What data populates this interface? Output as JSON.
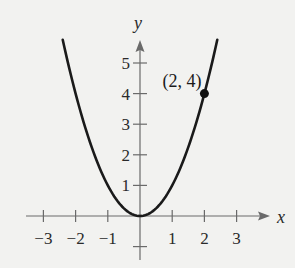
{
  "chart_data": {
    "type": "line",
    "title": "",
    "function": "y = x^2",
    "xlabel": "x",
    "ylabel": "y",
    "xlim": [
      -3,
      3
    ],
    "ylim": [
      -1,
      5.8
    ],
    "x_ticks": [
      -3,
      -2,
      -1,
      1,
      2,
      3
    ],
    "x_tick_labels": [
      "−3",
      "−2",
      "−1",
      "1",
      "2",
      "3"
    ],
    "y_ticks": [
      1,
      2,
      3,
      4,
      5
    ],
    "y_tick_labels": [
      "1",
      "2",
      "3",
      "4",
      "5"
    ],
    "grid": false,
    "series": [
      {
        "name": "parabola",
        "x": [
          -2.4,
          -2,
          -1.5,
          -1,
          -0.5,
          0,
          0.5,
          1,
          1.5,
          2,
          2.4
        ],
        "y": [
          5.76,
          4,
          2.25,
          1,
          0.25,
          0,
          0.25,
          1,
          2.25,
          4,
          5.76
        ]
      }
    ],
    "annotations": [
      {
        "x": 2,
        "y": 4,
        "label": "(2, 4)",
        "marker": "filled-circle"
      }
    ]
  },
  "style": {
    "axis_color": "#6a6a6a",
    "curve_color": "#1a1a1a",
    "background": "#f2f2f0"
  }
}
